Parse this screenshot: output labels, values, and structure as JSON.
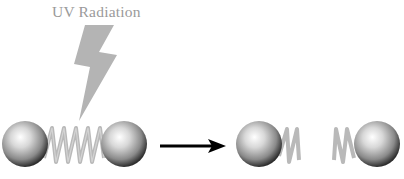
{
  "diagram": {
    "label": "UV Radiation",
    "colors": {
      "label": "#9a9a9a",
      "bolt": "#b4b4b4",
      "spring": "#b9b9b9",
      "sphere_light": "#ffffff",
      "sphere_dark": "#3a3a3a",
      "arrow": "#000000"
    },
    "before": {
      "description": "Two spheres connected by an intact spring",
      "spheres": 2,
      "spring": "intact"
    },
    "after": {
      "description": "Two spheres with broken spring halves",
      "spheres": 2,
      "spring": "broken"
    },
    "icons": [
      "lightning-bolt-icon",
      "right-arrow-icon"
    ]
  }
}
